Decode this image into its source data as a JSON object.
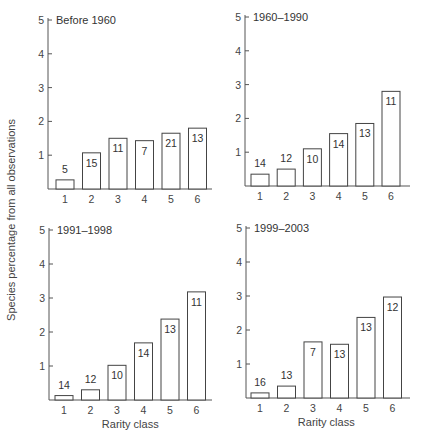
{
  "chart_data": [
    {
      "type": "bar",
      "title": "Before 1960",
      "categories": [
        "1",
        "2",
        "3",
        "4",
        "5",
        "6"
      ],
      "values": [
        0.27,
        1.07,
        1.5,
        1.43,
        1.65,
        1.8
      ],
      "bar_labels": [
        "5",
        "15",
        "11",
        "7",
        "21",
        "13"
      ],
      "xlabel": "",
      "ylabel": "Species percentage from all observations",
      "yticks": [
        1,
        2,
        3,
        4,
        5
      ],
      "ylim": [
        0,
        5
      ],
      "grid": false
    },
    {
      "type": "bar",
      "title": "1960–1990",
      "categories": [
        "1",
        "2",
        "3",
        "4",
        "5",
        "6"
      ],
      "values": [
        0.35,
        0.5,
        1.1,
        1.55,
        1.85,
        2.8
      ],
      "bar_labels": [
        "14",
        "12",
        "10",
        "14",
        "13",
        "11"
      ],
      "xlabel": "",
      "ylabel": "Species percentage from all observations",
      "yticks": [
        1,
        2,
        3,
        4,
        5
      ],
      "ylim": [
        0,
        5
      ],
      "grid": false
    },
    {
      "type": "bar",
      "title": "1991–1998",
      "categories": [
        "1",
        "2",
        "3",
        "4",
        "5",
        "6"
      ],
      "values": [
        0.13,
        0.3,
        1.02,
        1.68,
        2.38,
        3.18
      ],
      "bar_labels": [
        "14",
        "12",
        "10",
        "14",
        "13",
        "11"
      ],
      "xlabel": "Rarity class",
      "ylabel": "Species percentage from all observations",
      "yticks": [
        1,
        2,
        3,
        4,
        5
      ],
      "ylim": [
        0,
        5
      ],
      "grid": false
    },
    {
      "type": "bar",
      "title": "1999–2003",
      "categories": [
        "1",
        "2",
        "3",
        "4",
        "5",
        "6"
      ],
      "values": [
        0.15,
        0.35,
        1.65,
        1.58,
        2.37,
        2.97
      ],
      "bar_labels": [
        "16",
        "13",
        "7",
        "13",
        "13",
        "12"
      ],
      "xlabel": "Rarity class",
      "ylabel": "Species percentage from all observations",
      "yticks": [
        1,
        2,
        3,
        4,
        5
      ],
      "ylim": [
        0,
        5
      ],
      "grid": false
    }
  ],
  "shared": {
    "ylabel": "Species percentage from all observations"
  }
}
